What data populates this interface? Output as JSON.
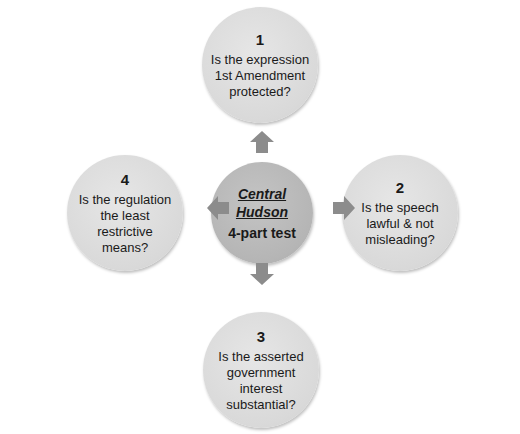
{
  "diagram": {
    "center": {
      "title_line1": "Central",
      "title_line2": "Hudson",
      "subtitle": "4-part test"
    },
    "steps": [
      {
        "number": "1",
        "line1": "Is the expression",
        "line2": "1st Amendment",
        "line3": "protected?",
        "line4": ""
      },
      {
        "number": "2",
        "line1": "Is the speech",
        "line2": "lawful & not",
        "line3": "misleading?",
        "line4": ""
      },
      {
        "number": "3",
        "line1": "Is the asserted",
        "line2": "government",
        "line3": "interest",
        "line4": "substantial?"
      },
      {
        "number": "4",
        "line1": "Is the regulation",
        "line2": "the least",
        "line3": "restrictive",
        "line4": "means?"
      }
    ],
    "colors": {
      "outer_circle": "#d9d9d9",
      "center_circle": "#b5b5b5",
      "arrow": "#8c8c8c",
      "text": "#1a1a1a"
    }
  }
}
